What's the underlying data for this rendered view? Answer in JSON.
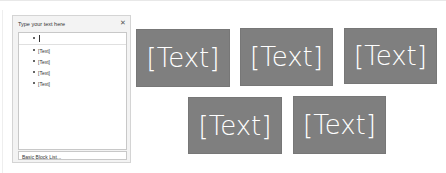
{
  "panel": {
    "title": "Type your text here",
    "close_icon": "close-icon",
    "items": [
      {
        "text": "",
        "active": true
      },
      {
        "text": "[Text]"
      },
      {
        "text": "[Text]"
      },
      {
        "text": "[Text]"
      },
      {
        "text": "[Text]"
      }
    ],
    "footer": "Basic Block List..."
  },
  "canvas": {
    "box_color": "#7f7f7f",
    "boxes": [
      {
        "text": "[Text]"
      },
      {
        "text": "[Text]"
      },
      {
        "text": "[Text]"
      },
      {
        "text": "[Text]"
      },
      {
        "text": "[Text]"
      }
    ]
  }
}
